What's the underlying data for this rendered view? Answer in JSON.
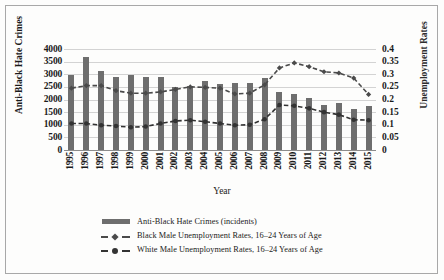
{
  "chart_data": {
    "type": "bar",
    "title": "",
    "xlabel": "Year",
    "ylabel": "Anti-Black Hate Crimes",
    "y2label": "Unemployment Rates",
    "ylim": [
      0,
      4000
    ],
    "y2lim": [
      0,
      0.4
    ],
    "grid": true,
    "legend_position": "bottom",
    "categories": [
      "1995",
      "1996",
      "1997",
      "1998",
      "1999",
      "2000",
      "2001",
      "2002",
      "2003",
      "2004",
      "2005",
      "2006",
      "2007",
      "2008",
      "2009",
      "2010",
      "2011",
      "2012",
      "2013",
      "2014",
      "2015"
    ],
    "y_ticks": [
      "4000",
      "3500",
      "3000",
      "2500",
      "2000",
      "1500",
      "1000",
      "500",
      "0"
    ],
    "y2_ticks": [
      "0.4",
      "0.35",
      "0.3",
      "0.25",
      "0.2",
      "0.15",
      "0.1",
      "0.05",
      "0"
    ],
    "series": [
      {
        "name": "Anti-Black Hate Crimes (incidents)",
        "type": "bar",
        "axis": "left",
        "color": "#6e6e6e",
        "values": [
          2990,
          3680,
          3130,
          2900,
          2960,
          2880,
          2900,
          2490,
          2550,
          2730,
          2630,
          2640,
          2650,
          2870,
          2290,
          2200,
          2070,
          1800,
          1860,
          1620,
          1740
        ]
      },
      {
        "name": "Black Male Unemployment Rates, 16–24 Years of Age",
        "type": "line",
        "axis": "right",
        "color": "#4a4a4a",
        "dash": "dashed",
        "values": [
          0.245,
          0.255,
          0.255,
          0.235,
          0.225,
          0.225,
          0.23,
          0.24,
          0.25,
          0.248,
          0.245,
          0.222,
          0.225,
          0.258,
          0.325,
          0.345,
          0.33,
          0.31,
          0.305,
          0.285,
          0.22
        ]
      },
      {
        "name": "White Male Unemployment Rates, 16–24 Years of Age",
        "type": "line",
        "axis": "right",
        "color": "#333333",
        "dash": "dashed",
        "values": [
          0.105,
          0.105,
          0.098,
          0.095,
          0.09,
          0.093,
          0.105,
          0.115,
          0.118,
          0.112,
          0.105,
          0.098,
          0.1,
          0.122,
          0.178,
          0.175,
          0.165,
          0.15,
          0.14,
          0.12,
          0.118
        ]
      }
    ]
  },
  "legend": {
    "items": [
      {
        "label": "Anti-Black Hate Crimes (incidents)",
        "marker": "bar-swatch"
      },
      {
        "label": "Black Male Unemployment Rates, 16–24 Years of Age",
        "marker": "dashed-diamond-line"
      },
      {
        "label": "White Male Unemployment Rates, 16–24 Years of Age",
        "marker": "dashed-circle-line"
      }
    ]
  },
  "axes": {
    "left_title": "Anti-Black Hate Crimes",
    "right_title": "Unemployment Rates",
    "x_title": "Year"
  },
  "colors": {
    "bar": "#6e6e6e",
    "grid": "#d3d3d3",
    "axis": "#8c8c8c",
    "text": "#1a1a1a",
    "frame": "#a8a8a8"
  }
}
